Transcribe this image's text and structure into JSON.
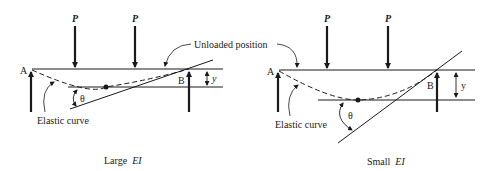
{
  "labels": {
    "load": "P",
    "support_a": "A",
    "support_b": "B",
    "deflection": "y",
    "angle": "θ",
    "elastic_curve": "Elastic curve",
    "unloaded_position": "Unloaded position"
  },
  "panels": [
    {
      "id": "large-ei",
      "caption_prefix": "Large",
      "caption_symbol": "EI"
    },
    {
      "id": "small-ei",
      "caption_prefix": "Small",
      "caption_symbol": "EI"
    }
  ],
  "colors": {
    "ink": "#1a1a1a",
    "background": "#ffffff"
  }
}
